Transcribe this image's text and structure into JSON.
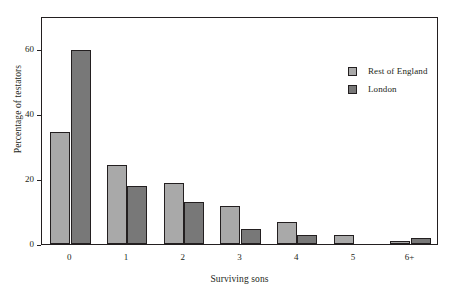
{
  "chart_data": {
    "type": "bar",
    "title": "",
    "subtitle": "",
    "xlabel": "Surviving sons",
    "ylabel": "Percentage of testators",
    "categories": [
      "0",
      "1",
      "2",
      "3",
      "4",
      "5",
      "6+"
    ],
    "series": [
      {
        "name": "Rest of England",
        "color": "#a9a9a9",
        "values": [
          34.5,
          24.3,
          18.7,
          11.8,
          6.7,
          2.8,
          1.0
        ]
      },
      {
        "name": "London",
        "color": "#787878",
        "values": [
          59.5,
          17.9,
          13.0,
          4.5,
          2.7,
          0.0,
          2.0
        ]
      }
    ],
    "ylim": [
      0,
      70
    ],
    "yticks": [
      0,
      20,
      40,
      60
    ],
    "ytick_labels": [
      "0",
      "20",
      "40",
      "60"
    ],
    "grid": false,
    "legend_position": "top-right",
    "frame": true
  },
  "legend": {
    "entries": [
      {
        "label": "Rest of England",
        "color": "#a9a9a9"
      },
      {
        "label": "London",
        "color": "#787878"
      }
    ]
  },
  "axes": {
    "y_title": "Percentage of testators",
    "x_title": "Surviving sons"
  },
  "colors": {
    "rest_of_england": "#a9a9a9",
    "london": "#787878",
    "axis": "#231f20",
    "background": "#ffffff"
  }
}
